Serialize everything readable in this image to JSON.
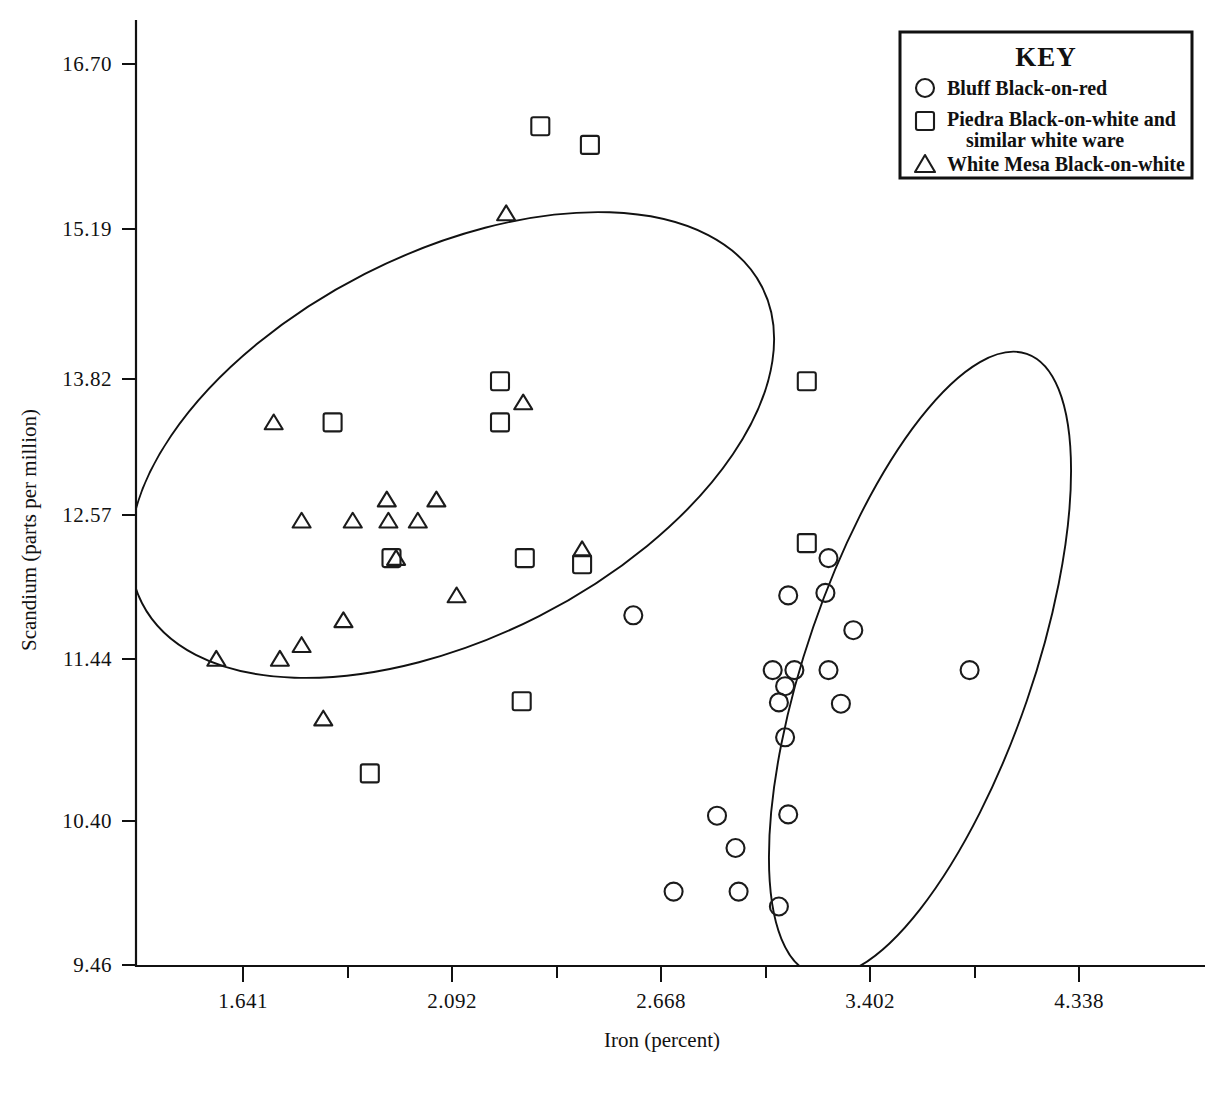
{
  "figure": {
    "background": "#ffffff",
    "ink_color": "#111111"
  },
  "legend": {
    "title": "KEY",
    "position": "top-right",
    "entries": [
      {
        "marker": "circle-marker",
        "label": "Bluff Black-on-red",
        "label2": ""
      },
      {
        "marker": "square-marker",
        "label": "Piedra Black-on-white and",
        "label2": "similar white ware"
      },
      {
        "marker": "triangle-marker",
        "label": "White  Mesa  Black-on-white",
        "label2": ""
      }
    ]
  },
  "chart_data": {
    "type": "scatter",
    "title": "",
    "xlabel": "Iron (percent)",
    "ylabel": "Scandium (parts per million)",
    "xlim": [
      1.38,
      4.69
    ],
    "ylim": [
      9.3,
      16.95
    ],
    "grid": false,
    "legend_position": "top-right",
    "xticks_labeled": [
      "1.641",
      "2.092",
      "2.668",
      "3.402",
      "4.338"
    ],
    "xticks_labeled_values": [
      1.641,
      2.092,
      2.668,
      3.402,
      4.338
    ],
    "xticks_minor_count": 5,
    "yticks_labeled": [
      "16.70",
      "15.19",
      "13.82",
      "12.57",
      "11.44",
      "10.40",
      "9.46"
    ],
    "yticks_labeled_values": [
      16.7,
      15.19,
      13.82,
      12.57,
      11.44,
      10.4,
      9.46
    ],
    "series": [
      {
        "name": "Bluff Black-on-red",
        "marker": "circle",
        "points": [
          [
            2.9,
            12.27
          ],
          [
            3.53,
            12.73
          ],
          [
            3.52,
            12.45
          ],
          [
            3.4,
            12.43
          ],
          [
            3.61,
            12.15
          ],
          [
            3.35,
            11.83
          ],
          [
            3.42,
            11.83
          ],
          [
            3.53,
            11.83
          ],
          [
            3.39,
            11.7
          ],
          [
            3.37,
            11.57
          ],
          [
            3.57,
            11.56
          ],
          [
            3.39,
            11.29
          ],
          [
            3.985,
            11.83
          ],
          [
            3.17,
            10.66
          ],
          [
            3.4,
            10.67
          ],
          [
            3.23,
            10.4
          ],
          [
            3.03,
            10.05
          ],
          [
            3.24,
            10.05
          ],
          [
            3.37,
            9.93
          ]
        ]
      },
      {
        "name": "Piedra Black-on-white and similar white ware",
        "marker": "square",
        "points": [
          [
            2.6,
            16.2
          ],
          [
            2.76,
            16.05
          ],
          [
            2.47,
            14.15
          ],
          [
            2.47,
            13.82
          ],
          [
            1.93,
            13.82
          ],
          [
            2.12,
            12.73
          ],
          [
            2.55,
            12.73
          ],
          [
            2.735,
            12.68
          ],
          [
            3.46,
            14.15
          ],
          [
            3.46,
            12.85
          ],
          [
            2.54,
            11.58
          ],
          [
            2.05,
            11.0
          ]
        ]
      },
      {
        "name": "White Mesa Black-on-white",
        "marker": "triangle",
        "points": [
          [
            2.49,
            15.5
          ],
          [
            2.545,
            13.98
          ],
          [
            1.74,
            13.82
          ],
          [
            2.105,
            13.2
          ],
          [
            2.265,
            13.2
          ],
          [
            1.83,
            13.03
          ],
          [
            1.995,
            13.03
          ],
          [
            2.11,
            13.03
          ],
          [
            2.205,
            13.03
          ],
          [
            2.135,
            12.73
          ],
          [
            2.33,
            12.43
          ],
          [
            1.965,
            12.23
          ],
          [
            1.555,
            11.92
          ],
          [
            1.76,
            11.92
          ],
          [
            1.83,
            12.03
          ],
          [
            1.9,
            11.44
          ],
          [
            2.735,
            12.8
          ]
        ]
      }
    ],
    "confidence_ellipses": [
      {
        "name": "left-group-ellipse",
        "group": "White Mesa / Piedra"
      },
      {
        "name": "right-group-ellipse",
        "group": "Bluff Black-on-red"
      }
    ]
  }
}
